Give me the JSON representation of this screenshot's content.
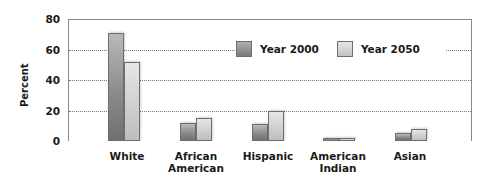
{
  "chart_data": {
    "type": "bar",
    "title": "",
    "xlabel": "",
    "ylabel": "Percent",
    "ylim": [
      0,
      80
    ],
    "yticks": [
      0,
      20,
      40,
      60,
      80
    ],
    "grid": true,
    "legend_position": "upper right (inside plot)",
    "categories": [
      "White",
      "African American",
      "Hispanic",
      "American Indian",
      "Asian"
    ],
    "category_lines": [
      [
        "White"
      ],
      [
        "African",
        "American"
      ],
      [
        "Hispanic"
      ],
      [
        "American",
        "Indian"
      ],
      [
        "Asian"
      ]
    ],
    "series": [
      {
        "name": "Year 2000",
        "values": [
          71,
          12,
          11,
          2,
          5
        ]
      },
      {
        "name": "Year 2050",
        "values": [
          52,
          15,
          20,
          2,
          8
        ]
      }
    ]
  },
  "axis": {
    "ylabel": "Percent",
    "ticks": [
      "0",
      "20",
      "40",
      "60",
      "80"
    ]
  },
  "legend": {
    "items": [
      {
        "label": "Year 2000"
      },
      {
        "label": "Year 2050"
      }
    ]
  },
  "categories": [
    {
      "line1": "White",
      "line2": ""
    },
    {
      "line1": "African",
      "line2": "American"
    },
    {
      "line1": "Hispanic",
      "line2": ""
    },
    {
      "line1": "American",
      "line2": "Indian"
    },
    {
      "line1": "Asian",
      "line2": ""
    }
  ],
  "colors": {
    "year_2000": "#8c8c8c",
    "year_2050": "#d0d0d0",
    "axis": "#8a8a8a",
    "grid": "#777777"
  }
}
